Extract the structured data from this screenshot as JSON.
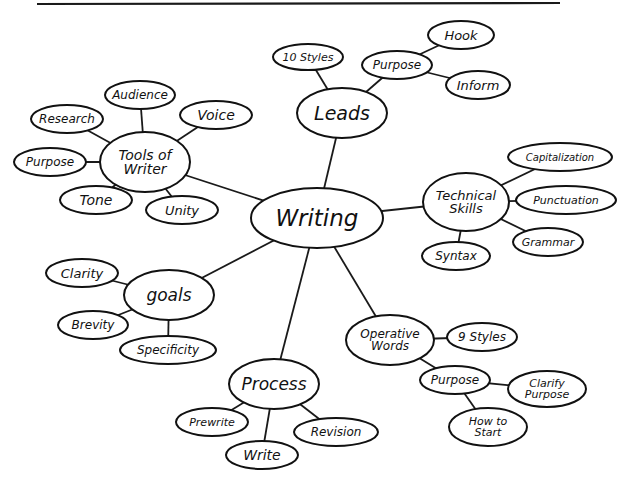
{
  "diagram": {
    "type": "mind-map",
    "top_rule": {
      "x1": 37,
      "y1": 4,
      "x2": 560,
      "y2": 3
    },
    "center": "writing",
    "nodes": [
      {
        "id": "writing",
        "label": [
          "Writing"
        ],
        "cx": 317,
        "cy": 218,
        "rx": 66,
        "ry": 30,
        "size": 23
      },
      {
        "id": "leads",
        "label": [
          "Leads"
        ],
        "cx": 342,
        "cy": 113,
        "rx": 45,
        "ry": 25,
        "size": 19
      },
      {
        "id": "ten-styles",
        "label": [
          "10 Styles"
        ],
        "cx": 308,
        "cy": 57,
        "rx": 35,
        "ry": 13,
        "size": 11
      },
      {
        "id": "leads-purpose",
        "label": [
          "Purpose"
        ],
        "cx": 397,
        "cy": 65,
        "rx": 35,
        "ry": 14,
        "size": 12
      },
      {
        "id": "hook",
        "label": [
          "Hook"
        ],
        "cx": 461,
        "cy": 35,
        "rx": 33,
        "ry": 14,
        "size": 13
      },
      {
        "id": "inform",
        "label": [
          "Inform"
        ],
        "cx": 478,
        "cy": 85,
        "rx": 32,
        "ry": 14,
        "size": 13
      },
      {
        "id": "tools-of-writer",
        "label": [
          "Tools of",
          "Writer"
        ],
        "cx": 145,
        "cy": 162,
        "rx": 45,
        "ry": 30,
        "size": 14
      },
      {
        "id": "audience",
        "label": [
          "Audience"
        ],
        "cx": 140,
        "cy": 95,
        "rx": 35,
        "ry": 14,
        "size": 12
      },
      {
        "id": "research",
        "label": [
          "Research"
        ],
        "cx": 67,
        "cy": 119,
        "rx": 36,
        "ry": 14,
        "size": 12
      },
      {
        "id": "voice",
        "label": [
          "Voice"
        ],
        "cx": 216,
        "cy": 115,
        "rx": 36,
        "ry": 14,
        "size": 14
      },
      {
        "id": "tools-purpose",
        "label": [
          "Purpose"
        ],
        "cx": 50,
        "cy": 162,
        "rx": 36,
        "ry": 14,
        "size": 12
      },
      {
        "id": "tone",
        "label": [
          "Tone"
        ],
        "cx": 96,
        "cy": 200,
        "rx": 36,
        "ry": 14,
        "size": 14
      },
      {
        "id": "unity",
        "label": [
          "Unity"
        ],
        "cx": 182,
        "cy": 210,
        "rx": 36,
        "ry": 14,
        "size": 13
      },
      {
        "id": "technical-skills",
        "label": [
          "Technical",
          "Skills"
        ],
        "cx": 466,
        "cy": 202,
        "rx": 43,
        "ry": 29,
        "size": 13
      },
      {
        "id": "capitalization",
        "label": [
          "Capitalization"
        ],
        "cx": 560,
        "cy": 157,
        "rx": 52,
        "ry": 14,
        "size": 10
      },
      {
        "id": "punctuation",
        "label": [
          "Punctuation"
        ],
        "cx": 566,
        "cy": 200,
        "rx": 50,
        "ry": 14,
        "size": 11
      },
      {
        "id": "grammar",
        "label": [
          "Grammar"
        ],
        "cx": 548,
        "cy": 242,
        "rx": 35,
        "ry": 14,
        "size": 11
      },
      {
        "id": "syntax",
        "label": [
          "Syntax"
        ],
        "cx": 456,
        "cy": 256,
        "rx": 34,
        "ry": 14,
        "size": 12
      },
      {
        "id": "goals",
        "label": [
          "goals"
        ],
        "cx": 169,
        "cy": 295,
        "rx": 45,
        "ry": 25,
        "size": 17
      },
      {
        "id": "clarity",
        "label": [
          "Clarity"
        ],
        "cx": 82,
        "cy": 273,
        "rx": 36,
        "ry": 14,
        "size": 13
      },
      {
        "id": "brevity",
        "label": [
          "Brevity"
        ],
        "cx": 93,
        "cy": 325,
        "rx": 35,
        "ry": 14,
        "size": 12
      },
      {
        "id": "specificity",
        "label": [
          "Specificity"
        ],
        "cx": 168,
        "cy": 350,
        "rx": 48,
        "ry": 14,
        "size": 12
      },
      {
        "id": "process",
        "label": [
          "Process"
        ],
        "cx": 274,
        "cy": 384,
        "rx": 45,
        "ry": 25,
        "size": 17
      },
      {
        "id": "prewrite",
        "label": [
          "Prewrite"
        ],
        "cx": 212,
        "cy": 422,
        "rx": 36,
        "ry": 14,
        "size": 11
      },
      {
        "id": "write",
        "label": [
          "Write"
        ],
        "cx": 262,
        "cy": 455,
        "rx": 36,
        "ry": 14,
        "size": 14
      },
      {
        "id": "revision",
        "label": [
          "Revision"
        ],
        "cx": 336,
        "cy": 432,
        "rx": 42,
        "ry": 14,
        "size": 12
      },
      {
        "id": "operative-words",
        "label": [
          "Operative",
          "Words"
        ],
        "cx": 390,
        "cy": 340,
        "rx": 44,
        "ry": 25,
        "size": 12
      },
      {
        "id": "nine-styles",
        "label": [
          "9 Styles"
        ],
        "cx": 482,
        "cy": 337,
        "rx": 35,
        "ry": 14,
        "size": 12
      },
      {
        "id": "operative-purpose",
        "label": [
          "Purpose"
        ],
        "cx": 455,
        "cy": 380,
        "rx": 35,
        "ry": 14,
        "size": 12
      },
      {
        "id": "clarify-purpose",
        "label": [
          "Clarify",
          "Purpose"
        ],
        "cx": 547,
        "cy": 389,
        "rx": 39,
        "ry": 18,
        "size": 11
      },
      {
        "id": "how-to-start",
        "label": [
          "How to",
          "Start"
        ],
        "cx": 488,
        "cy": 427,
        "rx": 39,
        "ry": 19,
        "size": 11
      }
    ],
    "edges": [
      [
        "writing",
        "leads"
      ],
      [
        "writing",
        "tools-of-writer"
      ],
      [
        "writing",
        "technical-skills"
      ],
      [
        "writing",
        "goals"
      ],
      [
        "writing",
        "process"
      ],
      [
        "writing",
        "operative-words"
      ],
      [
        "leads",
        "ten-styles"
      ],
      [
        "leads",
        "leads-purpose"
      ],
      [
        "leads-purpose",
        "hook"
      ],
      [
        "leads-purpose",
        "inform"
      ],
      [
        "tools-of-writer",
        "audience"
      ],
      [
        "tools-of-writer",
        "research"
      ],
      [
        "tools-of-writer",
        "voice"
      ],
      [
        "tools-of-writer",
        "tools-purpose"
      ],
      [
        "tools-of-writer",
        "tone"
      ],
      [
        "tools-of-writer",
        "unity"
      ],
      [
        "technical-skills",
        "capitalization"
      ],
      [
        "technical-skills",
        "punctuation"
      ],
      [
        "technical-skills",
        "grammar"
      ],
      [
        "technical-skills",
        "syntax"
      ],
      [
        "goals",
        "clarity"
      ],
      [
        "goals",
        "brevity"
      ],
      [
        "goals",
        "specificity"
      ],
      [
        "process",
        "prewrite"
      ],
      [
        "process",
        "write"
      ],
      [
        "process",
        "revision"
      ],
      [
        "operative-words",
        "nine-styles"
      ],
      [
        "operative-words",
        "operative-purpose"
      ],
      [
        "operative-purpose",
        "clarify-purpose"
      ],
      [
        "operative-purpose",
        "how-to-start"
      ]
    ]
  }
}
